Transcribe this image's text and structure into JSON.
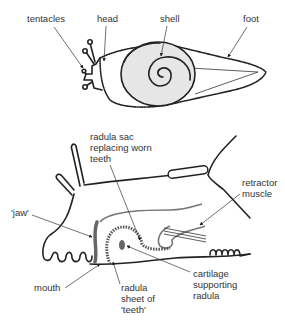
{
  "diagrams": [
    {
      "name": "snail-external",
      "labels": {
        "tentacles": "tentacles",
        "head": "head",
        "shell": "shell",
        "foot": "foot"
      }
    },
    {
      "name": "snail-mouth-section",
      "labels": {
        "radula_sac": [
          "radula sac",
          "replacing worn",
          "teeth"
        ],
        "retractor": [
          "retractor",
          "muscle"
        ],
        "jaw": "'jaw'",
        "mouth": "mouth",
        "radula": [
          "radula",
          "sheet of",
          "'teeth'"
        ],
        "cartilage": [
          "cartilage",
          "supporting",
          "radula"
        ]
      }
    }
  ],
  "colors": {
    "outline": "#222222",
    "shell_fill": "#e6e6e6",
    "grey_part": "#777777",
    "text": "#333333"
  }
}
